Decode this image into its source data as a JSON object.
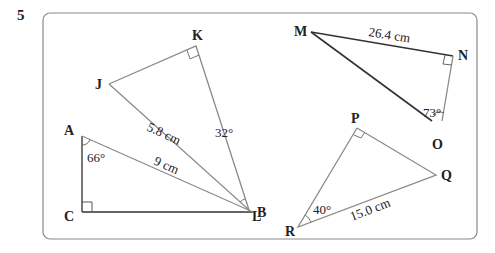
{
  "question": {
    "number": "5"
  },
  "triangles": [
    {
      "name": "JKL",
      "vertices": {
        "J": "J",
        "K": "K",
        "L": "L"
      },
      "right_angle_at": "K",
      "side_label": "5.8 cm",
      "angle_label": "32°"
    },
    {
      "name": "MNO",
      "vertices": {
        "M": "M",
        "N": "N",
        "O": "O"
      },
      "right_angle_at": "N",
      "side_label": "26.4 cm",
      "angle_label": "73°"
    },
    {
      "name": "ABC",
      "vertices": {
        "A": "A",
        "B": "B",
        "C": "C"
      },
      "right_angle_at": "C",
      "side_label": "9 cm",
      "angle_label": "66°"
    },
    {
      "name": "PQR",
      "vertices": {
        "P": "P",
        "Q": "Q",
        "R": "R"
      },
      "right_angle_at": "P",
      "side_label": "15.0 cm",
      "angle_label": "40°"
    }
  ],
  "colors": {
    "frame": "#888888",
    "line": "#8a8a8a",
    "dark_line": "#333333",
    "text": "#222222"
  }
}
